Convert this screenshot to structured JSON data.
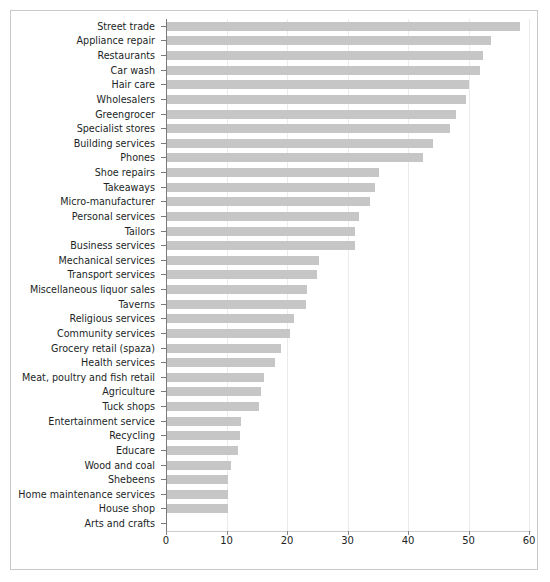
{
  "chart_data": {
    "type": "bar",
    "orientation": "horizontal",
    "title": "",
    "subtitle": "",
    "xlabel": "",
    "ylabel": "",
    "xlim": [
      0,
      60
    ],
    "xticks": [
      0,
      10,
      20,
      30,
      40,
      50,
      60
    ],
    "grid": "vertical",
    "legend": "none",
    "bar_color": "#c6c6c6",
    "categories": [
      "Street trade",
      "Appliance repair",
      "Restaurants",
      "Car wash",
      "Hair care",
      "Wholesalers",
      "Greengrocer",
      "Specialist stores",
      "Building services",
      "Phones",
      "Shoe repairs",
      "Takeaways",
      "Micro-manufacturer",
      "Personal services",
      "Tailors",
      "Business services",
      "Mechanical services",
      "Transport services",
      "Miscellaneous liquor sales",
      "Taverns",
      "Religious services",
      "Community services",
      "Grocery retail (spaza)",
      "Health services",
      "Meat, poultry and fish retail",
      "Agriculture",
      "Tuck shops",
      "Entertainment service",
      "Recycling",
      "Educare",
      "Wood and coal",
      "Shebeens",
      "Home maintenance services",
      "House shop",
      "Arts and crafts"
    ],
    "values": [
      58.4,
      53.5,
      52.2,
      51.7,
      49.9,
      49.4,
      47.8,
      46.7,
      44.0,
      42.3,
      35.0,
      34.4,
      33.6,
      31.8,
      31.1,
      31.0,
      25.2,
      24.8,
      23.1,
      23.0,
      21.0,
      20.4,
      18.8,
      17.9,
      16.0,
      15.5,
      15.2,
      12.2,
      12.0,
      11.8,
      10.5,
      10.0,
      10.0,
      10.0,
      0.0
    ]
  }
}
